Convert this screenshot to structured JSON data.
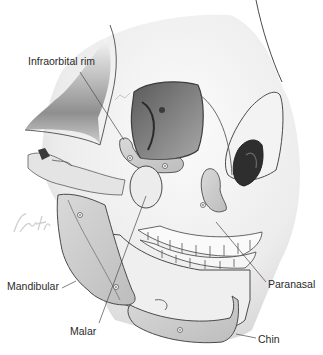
{
  "figure": {
    "labels": {
      "infraorbital_rim": "Infraorbital rim",
      "mandibular": "Mandibular",
      "malar": "Malar",
      "paranasal": "Paranasal",
      "chin": "Chin"
    },
    "colors": {
      "bone": "#f2f2f2",
      "outline": "#4a4a4a",
      "shadow": "#8a8a8a",
      "implant": "#d4d4d4",
      "text": "#2a2a2a"
    }
  }
}
